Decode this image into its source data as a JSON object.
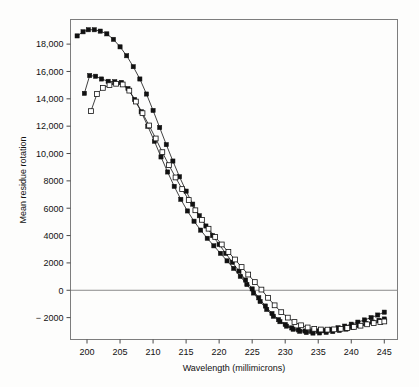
{
  "figure": {
    "background": "#fdfdfc",
    "frame_color": "#7d7d7d",
    "ink_color": "#111111"
  },
  "axes": {
    "x_title": "Wavelength (millimicrons)",
    "y_title": "Mean residue rotation",
    "x_ticks": [
      "200",
      "205",
      "210",
      "215",
      "220",
      "225",
      "230",
      "235",
      "240",
      "245"
    ],
    "y_ticks": [
      "18,000",
      "16,000",
      "14,000",
      "12,000",
      "10,000",
      "8000",
      "6000",
      "4000",
      "2000",
      "0",
      "− 2000"
    ]
  },
  "chart_data": {
    "type": "line",
    "title": "",
    "subtitle": "",
    "xlabel": "Wavelength (millimicrons)",
    "ylabel": "Mean residue rotation",
    "xlim": [
      197.5,
      247.0
    ],
    "ylim": [
      -3600,
      19800
    ],
    "xticks": [
      200,
      205,
      210,
      215,
      220,
      225,
      230,
      235,
      240,
      245
    ],
    "yticks": [
      -2000,
      0,
      2000,
      4000,
      6000,
      8000,
      10000,
      12000,
      14000,
      16000,
      18000
    ],
    "grid": false,
    "legend": "none",
    "annotations": [
      "zero reference line drawn at y = 0"
    ],
    "series": [
      {
        "name": "curve-a-high-peak",
        "marker": "filled-square",
        "marker_size": 2.1,
        "x": [
          198.5,
          199.4,
          200.2,
          201.1,
          202.0,
          203.0,
          204.0,
          205.0,
          206.0,
          207.0,
          208.0,
          209.0,
          210.0,
          211.0,
          212.0,
          213.0,
          214.0,
          215.0,
          216.0,
          217.0,
          218.0,
          219.0,
          220.0,
          221.0,
          222.0,
          223.0,
          224.0,
          225.0,
          226.0,
          227.0,
          228.0,
          229.0,
          230.0,
          231.0,
          232.0,
          233.0,
          234.0,
          235.0,
          236.0,
          237.0,
          238.0,
          239.0,
          240.0,
          241.0,
          242.0,
          243.0,
          244.0,
          245.0
        ],
        "y": [
          18600,
          18900,
          19050,
          19050,
          18950,
          18750,
          18350,
          17800,
          17150,
          16350,
          15450,
          14350,
          13150,
          11900,
          10650,
          9450,
          8300,
          7250,
          6300,
          5450,
          4700,
          4000,
          3350,
          2700,
          2050,
          1400,
          750,
          100,
          -550,
          -1150,
          -1700,
          -2150,
          -2500,
          -2750,
          -2900,
          -2980,
          -3000,
          -2980,
          -2930,
          -2850,
          -2740,
          -2620,
          -2480,
          -2330,
          -2170,
          -2000,
          -1810,
          -1600
        ]
      },
      {
        "name": "curve-b-mid-peak",
        "marker": "filled-square",
        "marker_size": 2.1,
        "x": [
          199.6,
          200.4,
          201.3,
          202.2,
          203.2,
          204.2,
          205.2,
          206.2,
          207.2,
          208.2,
          209.2,
          210.2,
          211.2,
          212.2,
          213.2,
          214.2,
          215.2,
          216.2,
          217.2,
          218.2,
          219.2,
          220.2,
          221.2,
          222.2,
          223.2,
          224.2,
          225.2,
          226.2,
          227.2,
          228.2,
          229.2,
          230.2,
          231.2,
          232.2,
          233.2,
          234.2,
          235.2,
          236.2,
          237.2,
          238.2,
          239.2,
          240.2,
          241.2,
          242.2,
          243.2,
          244.2,
          245.0
        ],
        "y": [
          14400,
          15700,
          15650,
          15450,
          15280,
          15250,
          15200,
          14750,
          13950,
          13050,
          12000,
          10900,
          9750,
          8650,
          7600,
          6650,
          5800,
          5050,
          4400,
          3800,
          3250,
          2700,
          2150,
          1600,
          1020,
          420,
          -200,
          -820,
          -1400,
          -1900,
          -2300,
          -2620,
          -2850,
          -3000,
          -3090,
          -3130,
          -3120,
          -3080,
          -3020,
          -2940,
          -2840,
          -2720,
          -2590,
          -2450,
          -2320,
          -2200,
          -2100
        ]
      },
      {
        "name": "curve-c-open-square",
        "marker": "open-square",
        "marker_size": 2.4,
        "x": [
          200.6,
          201.5,
          202.4,
          203.4,
          204.4,
          205.4,
          206.4,
          207.4,
          208.4,
          209.4,
          210.4,
          211.4,
          212.4,
          213.4,
          214.4,
          215.4,
          216.4,
          217.4,
          218.4,
          219.4,
          220.4,
          221.4,
          222.4,
          223.4,
          224.4,
          225.4,
          226.4,
          227.4,
          228.4,
          229.4,
          230.4,
          231.4,
          232.4,
          233.4,
          234.4,
          235.4,
          236.4,
          237.4,
          238.4,
          239.4,
          240.4,
          241.4,
          242.4,
          243.4,
          244.4,
          245.0
        ],
        "y": [
          13100,
          14350,
          14800,
          15000,
          15100,
          15050,
          14600,
          13800,
          12950,
          12050,
          11100,
          10100,
          9150,
          8250,
          7400,
          6600,
          5850,
          5150,
          4500,
          3900,
          3350,
          2800,
          2250,
          1700,
          1150,
          600,
          50,
          -550,
          -1100,
          -1600,
          -2000,
          -2320,
          -2560,
          -2720,
          -2820,
          -2870,
          -2880,
          -2860,
          -2820,
          -2760,
          -2680,
          -2590,
          -2490,
          -2400,
          -2320,
          -2280
        ]
      }
    ]
  }
}
